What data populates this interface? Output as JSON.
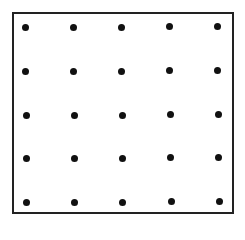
{
  "diagram": {
    "type": "dot-grid",
    "rows": 5,
    "columns": 5,
    "border_color": "#222222",
    "dot_color": "#111111",
    "dots": [
      {
        "x": 25,
        "y": 27
      },
      {
        "x": 73,
        "y": 27
      },
      {
        "x": 121,
        "y": 27
      },
      {
        "x": 169,
        "y": 26
      },
      {
        "x": 217,
        "y": 26
      },
      {
        "x": 25,
        "y": 71
      },
      {
        "x": 73,
        "y": 71
      },
      {
        "x": 121,
        "y": 71
      },
      {
        "x": 169,
        "y": 70
      },
      {
        "x": 217,
        "y": 70
      },
      {
        "x": 26,
        "y": 115
      },
      {
        "x": 74,
        "y": 115
      },
      {
        "x": 122,
        "y": 115
      },
      {
        "x": 170,
        "y": 114
      },
      {
        "x": 218,
        "y": 114
      },
      {
        "x": 26,
        "y": 158
      },
      {
        "x": 74,
        "y": 158
      },
      {
        "x": 122,
        "y": 158
      },
      {
        "x": 170,
        "y": 157
      },
      {
        "x": 218,
        "y": 157
      },
      {
        "x": 26,
        "y": 202
      },
      {
        "x": 74,
        "y": 202
      },
      {
        "x": 122,
        "y": 202
      },
      {
        "x": 171,
        "y": 201
      },
      {
        "x": 219,
        "y": 201
      }
    ]
  }
}
